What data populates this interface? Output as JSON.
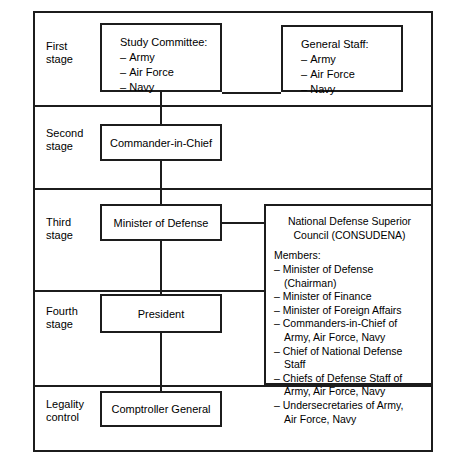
{
  "diagram": {
    "colors": {
      "line": "#1c1c1c",
      "background": "#ffffff",
      "text": "#000000"
    },
    "stages": [
      {
        "id": "first",
        "label": "First\nstage"
      },
      {
        "id": "second",
        "label": "Second\nstage"
      },
      {
        "id": "third",
        "label": "Third\nstage"
      },
      {
        "id": "fourth",
        "label": "Fourth\nstage"
      },
      {
        "id": "legality",
        "label": "Legality\ncontrol"
      }
    ],
    "nodes": {
      "study_committee": {
        "title": "Study Committee:",
        "items": [
          "Army",
          "Air Force",
          "Navy"
        ]
      },
      "general_staff": {
        "title": "General Staff:",
        "items": [
          "Army",
          "Air Force",
          "Navy"
        ]
      },
      "commander_in_chief": {
        "label": "Commander-in-Chief"
      },
      "minister_of_defense": {
        "label": "Minister of Defense"
      },
      "president": {
        "label": "President"
      },
      "comptroller_general": {
        "label": "Comptroller General"
      },
      "consudena": {
        "title": "National Defense Superior Council (CONSUDENA)",
        "members_heading": "Members:",
        "members": [
          "Minister of Defense (Chairman)",
          "Minister of Finance",
          "Minister of Foreign Affairs",
          "Commanders-in-Chief of\n Army, Air Force, Navy",
          "Chief of National Defense Staff",
          "Chiefs of Defense Staff of\n  Army,  Air Force, Navy",
          "Undersecretaries of Army,\n Air Force, Navy"
        ]
      }
    }
  }
}
